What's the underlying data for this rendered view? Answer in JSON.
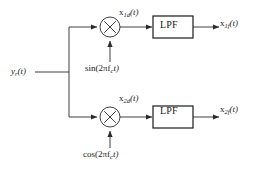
{
  "diagram": {
    "background_color": "#ffffff",
    "line_color": "#2b2b2b",
    "text_color": "#1a1a1a",
    "input": {
      "label_main": "y",
      "label_sub": "r",
      "label_tail": "(t)",
      "full": "y_r(t)"
    },
    "branches": [
      {
        "name": "in-phase-branch",
        "mixer_symbol": "×",
        "mixer_name": "multiplier",
        "carrier": {
          "fn": "sin",
          "open": "(2πf",
          "sub": "c",
          "close": "t)",
          "full": "sin(2πf_c t)"
        },
        "mixer_output": {
          "main": "x",
          "sub": "1d",
          "tail": "(t)",
          "full": "x_1d(t)"
        },
        "filter_label": "LPF",
        "filter_name": "low-pass-filter",
        "output": {
          "main": "x",
          "sub": "1f",
          "tail": "(t)",
          "full": "x_1f(t)"
        }
      },
      {
        "name": "quadrature-branch",
        "mixer_symbol": "×",
        "mixer_name": "multiplier",
        "carrier": {
          "fn": "cos",
          "open": "(2πf",
          "sub": "c",
          "close": "t)",
          "full": "cos(2πf_c t)"
        },
        "mixer_output": {
          "main": "x",
          "sub": "2d",
          "tail": "(t)",
          "full": "x_2d(t)"
        },
        "filter_label": "LPF",
        "filter_name": "low-pass-filter",
        "output": {
          "main": "x",
          "sub": "2f",
          "tail": "(t)",
          "full": "x_2f(t)"
        }
      }
    ]
  }
}
